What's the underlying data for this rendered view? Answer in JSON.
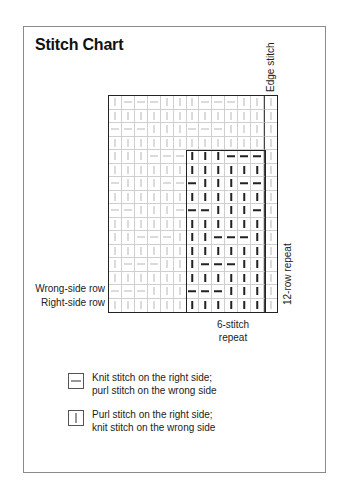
{
  "title": "Stitch Chart",
  "labels": {
    "edge_stitch": "Edge stitch",
    "wrong_side_row": "Wrong-side row",
    "right_side_row": "Right-side row",
    "row_repeat": "12-row repeat",
    "stitch_repeat_line1": "6-stitch",
    "stitch_repeat_line2": "repeat"
  },
  "legend": [
    {
      "symbol": "knit",
      "line1": "Knit stitch on the right side;",
      "line2": "purl stitch on the wrong side"
    },
    {
      "symbol": "purl",
      "line1": "Purl stitch on the right side;",
      "line2": "knit stitch on the wrong side"
    }
  ],
  "chart": {
    "columns": 13,
    "rows": 16,
    "edge_stitch_column": 12,
    "repeat": {
      "col_start": 6,
      "col_end": 11,
      "row_start": 4,
      "row_end": 15
    },
    "symbols_key": {
      "K": "knit-dash",
      "P": "purl-bar"
    },
    "grid": [
      "PKKKPPPKKKPPP",
      "PPPPPPPPPPPPP",
      "KKKPPPKKKPPPP",
      "PPPPPPPPPPPPP",
      "PPPKKKPPPKKKP",
      "PPPPPPPPPPPPP",
      "KPPPKKKPPPKKP",
      "PPPPPPPPPPPPP",
      "KKPPPKKKPPPKP",
      "PPPPPPPPPPPPP",
      "PPKKKPPPKKKPP",
      "PPPPPPPPPPPPP",
      "PKKKPPPKKKPPP",
      "PPPPPPPPPPPPP",
      "KKKPPPKKKPPPP",
      "PPPPPPPPPPPPP"
    ]
  }
}
